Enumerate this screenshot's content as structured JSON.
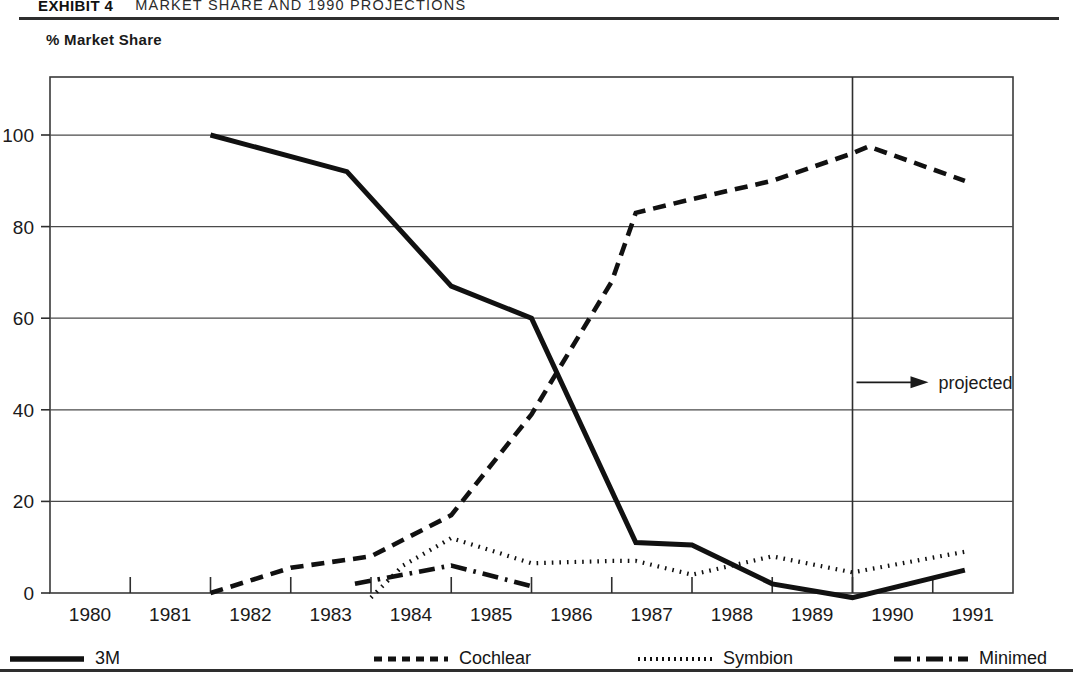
{
  "header": {
    "exhibit_label": "EXHIBIT 4",
    "title": "MARKET SHARE AND 1990 PROJECTIONS"
  },
  "axis_caption": "% Market Share",
  "annotation": {
    "projected_label": "projected",
    "projected_divider_year": 1990
  },
  "legend": {
    "items": [
      {
        "label": "3M",
        "style": "solid",
        "color": "#111111"
      },
      {
        "label": "Cochlear",
        "style": "dashed",
        "color": "#111111"
      },
      {
        "label": "Symbion",
        "style": "dotted",
        "color": "#111111"
      },
      {
        "label": "Minimed",
        "style": "dashdot",
        "color": "#111111"
      }
    ]
  },
  "chart_data": {
    "type": "line",
    "title": "MARKET SHARE AND 1990 PROJECTIONS",
    "xlabel": "",
    "ylabel": "% Market Share",
    "xlim": [
      1980,
      1992
    ],
    "ylim": [
      -4,
      112
    ],
    "grid": "horizontal",
    "yticks": [
      0,
      20,
      40,
      60,
      80,
      100
    ],
    "xticks": [
      1980,
      1981,
      1982,
      1983,
      1984,
      1985,
      1986,
      1987,
      1988,
      1989,
      1990,
      1991
    ],
    "tick_labels_x": [
      "1980",
      "1981",
      "1982",
      "1983",
      "1984",
      "1985",
      "1986",
      "1987",
      "1988",
      "1989",
      "1990",
      "1991"
    ],
    "tick_labels_y": [
      "0",
      "20",
      "40",
      "60",
      "80",
      "100"
    ],
    "legend_position": "bottom",
    "annotations": [
      {
        "text": "projected",
        "x": 1990,
        "y": 46,
        "arrow": "right"
      }
    ],
    "series": [
      {
        "name": "3M",
        "style": "solid",
        "points": [
          {
            "x": 1982.0,
            "y": 100
          },
          {
            "x": 1983.7,
            "y": 92
          },
          {
            "x": 1985.0,
            "y": 67
          },
          {
            "x": 1986.0,
            "y": 60
          },
          {
            "x": 1987.3,
            "y": 11
          },
          {
            "x": 1988.0,
            "y": 10.5
          },
          {
            "x": 1989.0,
            "y": 2
          },
          {
            "x": 1990.0,
            "y": -1
          },
          {
            "x": 1991.4,
            "y": 5
          }
        ]
      },
      {
        "name": "Cochlear",
        "style": "dashed",
        "points": [
          {
            "x": 1982.0,
            "y": 0
          },
          {
            "x": 1983.0,
            "y": 5.5
          },
          {
            "x": 1984.0,
            "y": 8
          },
          {
            "x": 1985.0,
            "y": 17
          },
          {
            "x": 1986.0,
            "y": 39
          },
          {
            "x": 1987.0,
            "y": 68
          },
          {
            "x": 1987.3,
            "y": 83
          },
          {
            "x": 1988.0,
            "y": 86
          },
          {
            "x": 1989.0,
            "y": 90
          },
          {
            "x": 1990.0,
            "y": 96
          },
          {
            "x": 1990.2,
            "y": 97.5
          },
          {
            "x": 1991.4,
            "y": 90
          }
        ]
      },
      {
        "name": "Symbion",
        "style": "dotted",
        "points": [
          {
            "x": 1984.0,
            "y": -1
          },
          {
            "x": 1984.4,
            "y": 6
          },
          {
            "x": 1985.0,
            "y": 12
          },
          {
            "x": 1986.0,
            "y": 6.5
          },
          {
            "x": 1987.0,
            "y": 7
          },
          {
            "x": 1987.3,
            "y": 7
          },
          {
            "x": 1988.0,
            "y": 4
          },
          {
            "x": 1989.0,
            "y": 8
          },
          {
            "x": 1990.0,
            "y": 4.5
          },
          {
            "x": 1991.4,
            "y": 9
          }
        ]
      },
      {
        "name": "Minimed",
        "style": "dashdot",
        "points": [
          {
            "x": 1983.8,
            "y": 2
          },
          {
            "x": 1985.0,
            "y": 6
          },
          {
            "x": 1986.0,
            "y": 1.5
          }
        ]
      }
    ]
  }
}
